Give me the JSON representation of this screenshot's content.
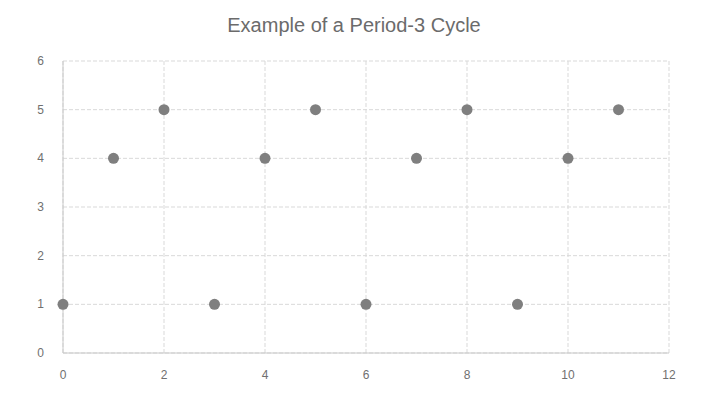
{
  "chart_data": {
    "type": "scatter",
    "title": "Example of a Period-3 Cycle",
    "xlabel": "",
    "ylabel": "",
    "xlim": [
      0,
      12
    ],
    "ylim": [
      0,
      6
    ],
    "x_ticks": [
      0,
      2,
      4,
      6,
      8,
      10,
      12
    ],
    "y_ticks": [
      0,
      1,
      2,
      3,
      4,
      5,
      6
    ],
    "grid": true,
    "legend": null,
    "series": [
      {
        "name": "Series1",
        "color": "#7f7f7f",
        "x": [
          0,
          1,
          2,
          3,
          4,
          5,
          6,
          7,
          8,
          9,
          10,
          11
        ],
        "y": [
          1,
          4,
          5,
          1,
          4,
          5,
          1,
          4,
          5,
          1,
          4,
          5
        ]
      }
    ]
  }
}
